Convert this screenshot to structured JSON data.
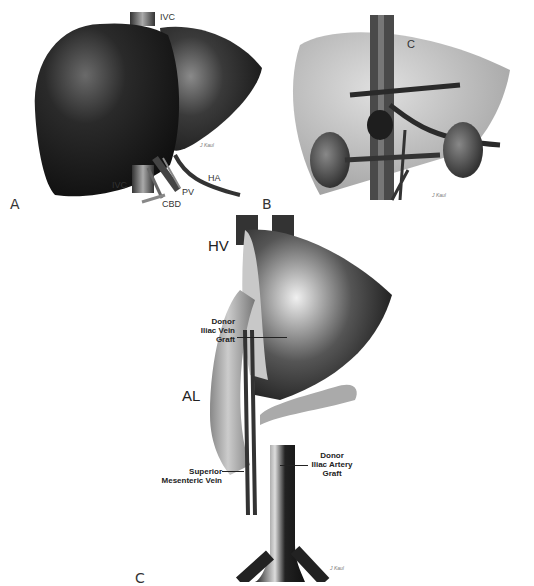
{
  "figure": {
    "panels": [
      {
        "id": "A",
        "letter": "A",
        "labels": {
          "ivc_top": "IVC",
          "ivc_bottom": "IVC",
          "pv": "PV",
          "ha": "HA",
          "cbd": "CBD"
        },
        "signature": "J Kaul"
      },
      {
        "id": "B",
        "letter": "B",
        "labels": {
          "c": "C"
        },
        "signature": "J Kaul"
      },
      {
        "id": "C",
        "letter": "C",
        "labels": {
          "hv": "HV",
          "al": "AL",
          "donor_iliac_vein_graft": [
            "Donor",
            "Iliac Vein",
            "Graft"
          ],
          "donor_iliac_artery_graft": [
            "Donor",
            "Iliac Artery",
            "Graft"
          ],
          "superior_mesenteric_vein": [
            "Superior",
            "Mesenteric Vein"
          ]
        },
        "signature": "J Kaul"
      }
    ],
    "colors": {
      "organ_dark": "#1a1a1a",
      "organ_light": "#b5b5b5",
      "background": "#ffffff"
    }
  }
}
